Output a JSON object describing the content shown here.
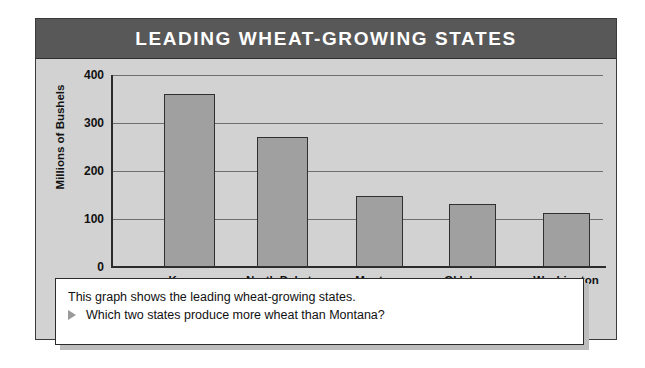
{
  "card": {
    "title": "LEADING WHEAT-GROWING STATES"
  },
  "chart_data": {
    "type": "bar",
    "title": "LEADING WHEAT-GROWING STATES",
    "categories": [
      "Kansas",
      "North Dakota",
      "Montana",
      "Oklahoma",
      "Washington"
    ],
    "values": [
      360,
      270,
      148,
      131,
      113
    ],
    "xlabel": "",
    "ylabel": "Millions of Bushels",
    "ylim": [
      0,
      400
    ],
    "yticks": [
      0,
      100,
      200,
      300,
      400
    ],
    "ytick_labels": [
      "0",
      "100",
      "200",
      "300",
      "400"
    ],
    "grid": true,
    "legend": "none",
    "bar_color": "#a0a0a0",
    "bar_border_color": "#303030",
    "plot_background": "#d2d2d2",
    "title_band_color": "#585858"
  },
  "caption": {
    "line1": "This graph shows the leading wheat-growing states.",
    "bullet_icon": "triangle-right-icon",
    "line2": "Which two states produce more wheat than Montana?"
  }
}
